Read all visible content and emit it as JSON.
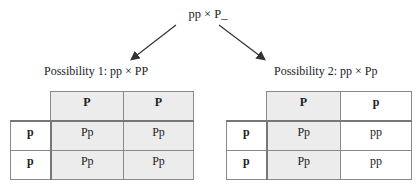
{
  "diagram": {
    "root": "pp × P_",
    "possibility_1": {
      "label": "Possibility 1: pp × PP",
      "col_headers": [
        "P",
        "P"
      ],
      "row_headers": [
        "p",
        "p"
      ],
      "cells": [
        [
          "Pp",
          "Pp"
        ],
        [
          "Pp",
          "Pp"
        ]
      ]
    },
    "possibility_2": {
      "label": "Possibility 2: pp × Pp",
      "col_headers": [
        "P",
        "p"
      ],
      "row_headers": [
        "p",
        "p"
      ],
      "cells": [
        [
          "Pp",
          "pp"
        ],
        [
          "Pp",
          "pp"
        ]
      ]
    },
    "colors": {
      "shaded": "#ececec",
      "border": "#8a8a8a",
      "arrow": "#333333"
    }
  }
}
